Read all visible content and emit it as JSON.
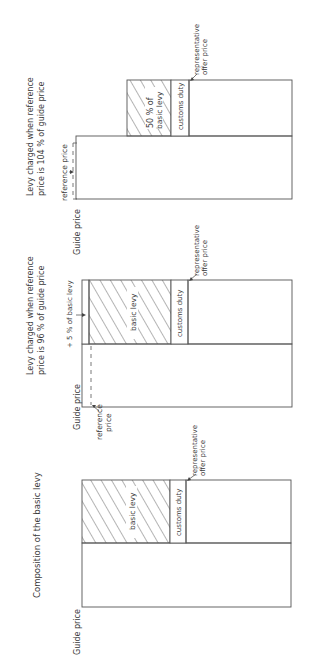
{
  "figure": {
    "orientation": "rotated 90 degrees counter-clockwise",
    "panels": [
      {
        "id": "basic",
        "title": "Composition of the basic levy",
        "labels": {
          "guide_price": "Guide price",
          "basic_levy": "basic levy",
          "customs_duty": "customs duty",
          "representative_offer_price_1": "representative",
          "representative_offer_price_2": "offer price"
        }
      },
      {
        "id": "ref96",
        "title_line1": "Levy charged when reference",
        "title_line2": "price is 96 % of guide price",
        "labels": {
          "guide_price": "Guide price",
          "reference_price_1": "reference",
          "reference_price_2": "price",
          "plus_five": "+ 5 % of basic levy",
          "basic_levy": "basic levy",
          "customs_duty": "customs duty",
          "representative_offer_price_1": "representative",
          "representative_offer_price_2": "offer price"
        }
      },
      {
        "id": "ref104",
        "title_line1": "Levy charged when reference",
        "title_line2": "price is 104 % of guide price",
        "labels": {
          "guide_price": "Guide price",
          "reference_price": "reference price",
          "fifty_1": "50 % of",
          "fifty_2": "basic levy",
          "customs_duty": "customs duty",
          "representative_offer_price_1": "representative",
          "representative_offer_price_2": "offer price"
        }
      }
    ],
    "colors": {
      "line": "#555555",
      "hatch": "#444444",
      "text": "#3a3a3a",
      "background": "#ffffff"
    }
  }
}
